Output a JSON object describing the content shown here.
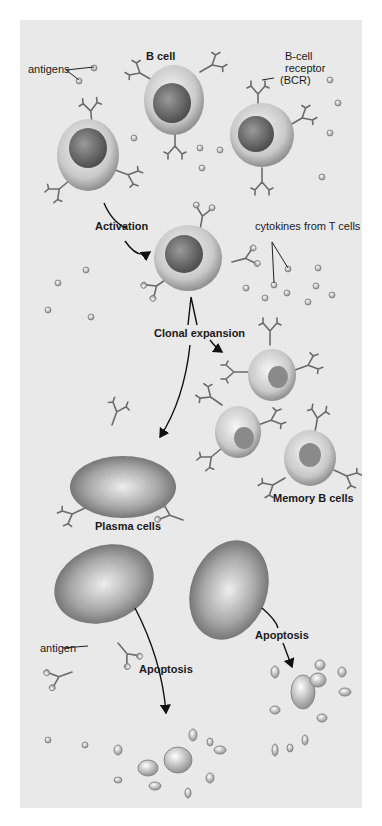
{
  "diagram": {
    "type": "biological process illustration",
    "labels": {
      "antigens": "antigens",
      "b_cell": "B cell",
      "bcr_line1": "B-cell",
      "bcr_line2": "receptor",
      "bcr_line3": "(BCR)",
      "activation": "Activation",
      "cytokines": "cytokines from T cells",
      "clonal_expansion": "Clonal expansion",
      "memory_b_cells": "Memory B cells",
      "plasma_cells": "Plasma cells",
      "antigen": "antigen",
      "apoptosis_left": "Apoptosis",
      "apoptosis_right": "Apoptosis"
    },
    "stages": [
      "B cell",
      "Activation",
      "Clonal expansion",
      "Memory B cells",
      "Plasma cells",
      "Apoptosis"
    ],
    "colors": {
      "page_bg": "#ffffff",
      "panel_bg": "#e9e9e9",
      "cell_light": "#f4f4f4",
      "cell_dark": "#7a7a7a",
      "receptor": "#6b6b6b",
      "arrow": "#111111",
      "text": "#1a1a1a"
    }
  }
}
